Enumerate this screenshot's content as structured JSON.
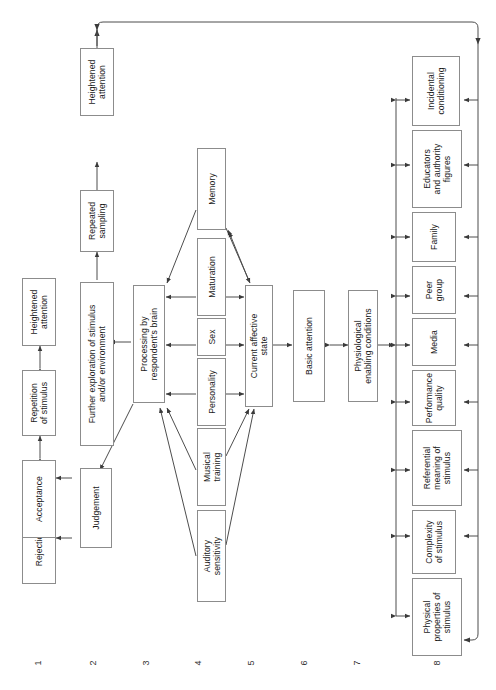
{
  "diagram": {
    "orientation": "rotated-90-ccw",
    "row_numbers": [
      "1",
      "2",
      "3",
      "4",
      "5",
      "6",
      "7",
      "8"
    ],
    "nodes": {
      "rejection": "Rejection",
      "acceptance": "Acceptance",
      "repetition_of_stimulus": "Repetition\nof stimulus",
      "heightened_attention_1": "Heightened\nattention",
      "judgement": "Judgement",
      "further_exploration": "Further exploration of stimulus\nand/or environment",
      "repeated_sampling": "Repeated\nsampling",
      "heightened_attention_2": "Heightened\nattention",
      "processing_brain": "Processing by\nrespondent's brain",
      "auditory_sensitivity": "Auditory\nsensitivity",
      "musical_training": "Musical\ntraining",
      "personality": "Personality",
      "sex": "Sex",
      "maturation": "Maturation",
      "memory": "Memory",
      "current_affective_state": "Current affective\nstate",
      "basic_attention": "Basic attention",
      "physiological_enabling": "Physiological\nenabling conditions",
      "physical_properties": "Physical\nproperties of\nstimulus",
      "complexity_of_stimulus": "Complexity\nof stimulus",
      "referential_meaning": "Referential\nmeaning of\nstimulus",
      "performance_quality": "Performance\nquality",
      "media": "Media",
      "peer_group": "Peer\ngroup",
      "family": "Family",
      "educators": "Educators\nand authority\nfigures",
      "incidental_conditioning": "Incidental\nconditioning"
    },
    "colors": {
      "box_border": "#8c8c8c",
      "line": "#4d4d4d",
      "text": "#1a1a1a",
      "background": "#ffffff"
    }
  }
}
